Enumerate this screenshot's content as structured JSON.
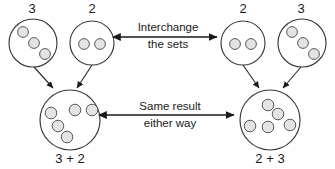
{
  "diagram": {
    "title_visible": false,
    "background_color": "#ffffff",
    "stroke_color": "#2b2b2b",
    "dot_fill_color": "#e3e3e3",
    "dot_stroke_color": "#5a5a5a"
  },
  "top_row": {
    "left_pair": [
      {
        "id": "top-left-set",
        "count_label": "3",
        "dot_count": 3
      },
      {
        "id": "top-mid-left-set",
        "count_label": "2",
        "dot_count": 2
      }
    ],
    "right_pair": [
      {
        "id": "top-mid-right-set",
        "count_label": "2",
        "dot_count": 2
      },
      {
        "id": "top-right-set",
        "count_label": "3",
        "dot_count": 3
      }
    ]
  },
  "bottom_row": {
    "left_result": {
      "id": "bottom-left-set",
      "sum_label": "3 + 2",
      "dot_count": 5
    },
    "right_result": {
      "id": "bottom-right-set",
      "sum_label": "2 + 3",
      "dot_count": 5
    }
  },
  "annotations": {
    "top_arrow": {
      "line1": "Interchange",
      "line2": "the sets",
      "direction": "bidirectional"
    },
    "bottom_arrow": {
      "line1": "Same result",
      "line2": "either way",
      "direction": "bidirectional"
    }
  }
}
